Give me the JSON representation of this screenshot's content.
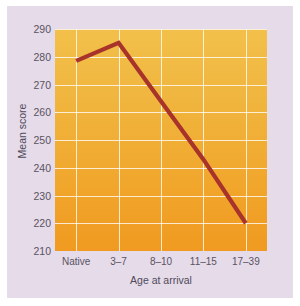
{
  "chart_data": {
    "type": "line",
    "title": "",
    "xlabel": "Age at arrival",
    "ylabel": "Mean score",
    "categories": [
      "Native",
      "3–7",
      "8–10",
      "11–15",
      "17–39"
    ],
    "values": [
      278.5,
      285,
      264,
      243,
      220
    ],
    "ylim": [
      210,
      290
    ],
    "yticks": [
      290,
      280,
      270,
      260,
      250,
      240,
      230,
      220,
      210
    ],
    "ytick_labels": [
      "290",
      "280",
      "270",
      "260",
      "250",
      "240",
      "230",
      "220",
      "210"
    ],
    "grid": true,
    "legend": false,
    "legend_position": "none",
    "series": [
      {
        "name": "Mean score",
        "values": [
          278.5,
          285,
          264,
          243,
          220
        ],
        "color": "#a8332a"
      }
    ],
    "colors": {
      "line": "#a8332a",
      "plot_background_top": "#f2c04a",
      "plot_background_bottom": "#f09a21",
      "panel_background": "#e6dbe9",
      "gridline": "#ffffff",
      "tick_text": "#595362",
      "page_background": "#ffffff"
    }
  }
}
